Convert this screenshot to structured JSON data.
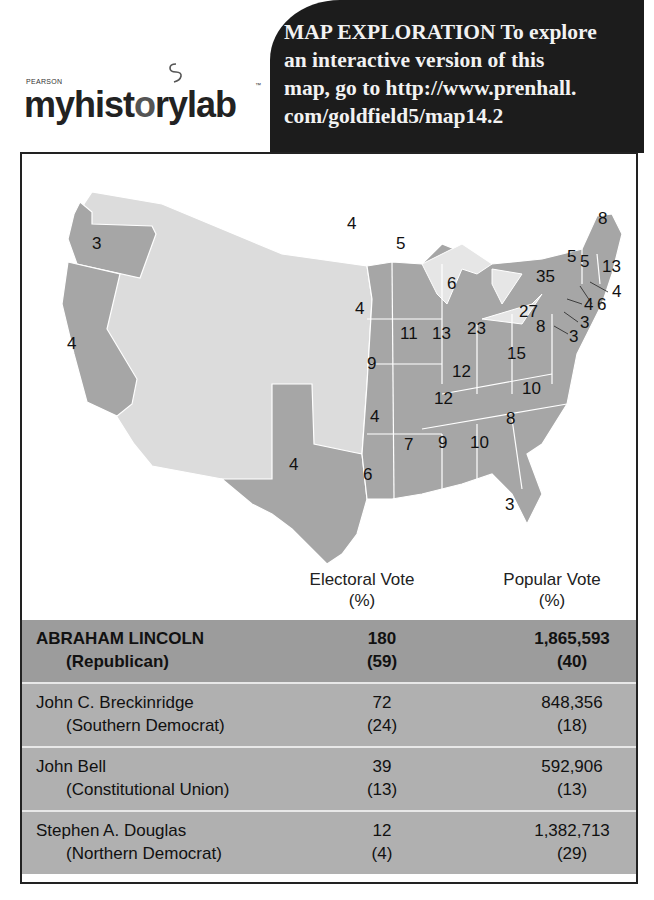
{
  "logo": {
    "publisher": "PEARSON",
    "brand_dark_1": "myhist",
    "brand_light": "o",
    "brand_dark_2": "rylab",
    "trademark": "™"
  },
  "callout": {
    "text": "MAP EXPLORATION  To explore an interactive version of this map, go to http://www.prenhall.com/goldfield5/map14.2",
    "line1": "MAP EXPLORATION  To explore",
    "line2": "an interactive version of this",
    "line3": "map, go to http://www.prenhall.",
    "line4": "com/goldfield5/map14.2"
  },
  "colors": {
    "callout_bg": "#1c1c1c",
    "state_voted": "#a6a6a6",
    "territory": "#dcdcdc",
    "lincoln_row": "#9c9c9c",
    "other_row": "#b0b0b0"
  },
  "map": {
    "state_labels": [
      {
        "state": "Oregon",
        "ev": "3"
      },
      {
        "state": "California",
        "ev": "4"
      },
      {
        "state": "Minnesota",
        "ev": "4"
      },
      {
        "state": "Wisconsin",
        "ev": "5"
      },
      {
        "state": "Michigan",
        "ev": "6"
      },
      {
        "state": "Iowa",
        "ev": "4"
      },
      {
        "state": "Illinois",
        "ev": "11"
      },
      {
        "state": "Indiana",
        "ev": "13"
      },
      {
        "state": "Ohio",
        "ev": "23"
      },
      {
        "state": "Missouri",
        "ev": "9"
      },
      {
        "state": "Kentucky",
        "ev": "12"
      },
      {
        "state": "Virginia",
        "ev": "15"
      },
      {
        "state": "Tennessee",
        "ev": "12"
      },
      {
        "state": "North Carolina",
        "ev": "10"
      },
      {
        "state": "Arkansas",
        "ev": "4"
      },
      {
        "state": "South Carolina",
        "ev": "8"
      },
      {
        "state": "Mississippi",
        "ev": "7"
      },
      {
        "state": "Alabama",
        "ev": "9"
      },
      {
        "state": "Georgia",
        "ev": "10"
      },
      {
        "state": "Texas",
        "ev": "4"
      },
      {
        "state": "Louisiana",
        "ev": "6"
      },
      {
        "state": "Florida",
        "ev": "3"
      },
      {
        "state": "Pennsylvania",
        "ev": "27"
      },
      {
        "state": "Maryland",
        "ev": "8"
      },
      {
        "state": "New York",
        "ev": "35"
      },
      {
        "state": "Vermont",
        "ev": "5"
      },
      {
        "state": "New Hampshire",
        "ev": "5"
      },
      {
        "state": "Maine",
        "ev": "8"
      },
      {
        "state": "Massachusetts",
        "ev": "13"
      },
      {
        "state": "Rhode Island",
        "ev": "4"
      },
      {
        "state": "Connecticut",
        "ev": "6"
      },
      {
        "state": "New Jersey",
        "ev": "4"
      },
      {
        "state": "Delaware (upper)",
        "ev": "3"
      },
      {
        "state": "Delaware (lower)",
        "ev": "3"
      }
    ]
  },
  "table": {
    "headers": {
      "electoral_line1": "Electoral Vote",
      "electoral_line2": "(%)",
      "popular_line1": "Popular Vote",
      "popular_line2": "(%)"
    },
    "rows": [
      {
        "name": "ABRAHAM LINCOLN",
        "party": "(Republican)",
        "ev": "180",
        "ev_pct": "(59)",
        "pv": "1,865,593",
        "pv_pct": "(40)"
      },
      {
        "name": "John C. Breckinridge",
        "party": "(Southern Democrat)",
        "ev": "72",
        "ev_pct": "(24)",
        "pv": "848,356",
        "pv_pct": "(18)"
      },
      {
        "name": "John Bell",
        "party": "(Constitutional Union)",
        "ev": "39",
        "ev_pct": "(13)",
        "pv": "592,906",
        "pv_pct": "(13)"
      },
      {
        "name": "Stephen A. Douglas",
        "party": "(Northern Democrat)",
        "ev": "12",
        "ev_pct": "(4)",
        "pv": "1,382,713",
        "pv_pct": "(29)"
      }
    ]
  }
}
